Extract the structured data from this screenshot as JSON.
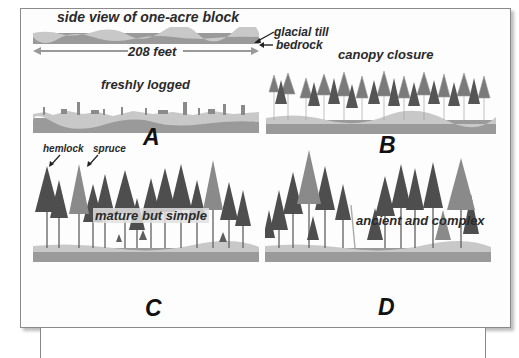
{
  "legend": {
    "title": "side view of one-acre block",
    "glacial_till": "glacial till",
    "bedrock": "bedrock",
    "width": "208 feet"
  },
  "panels": [
    {
      "letter": "A",
      "caption": "freshly logged"
    },
    {
      "letter": "B",
      "caption": "canopy closure"
    },
    {
      "letter": "C",
      "caption": "mature but simple",
      "species_labels": [
        "hemlock",
        "spruce"
      ]
    },
    {
      "letter": "D",
      "caption": "ancient and complex"
    }
  ],
  "colors": {
    "bedrock": "#9a9a9a",
    "glacial_till": "#c8c8c8",
    "tree_dark": "#4a4a4a",
    "tree_mid": "#6e6e6e",
    "tree_light": "#8e8e8e",
    "frame_border": "#8a8a8a"
  }
}
